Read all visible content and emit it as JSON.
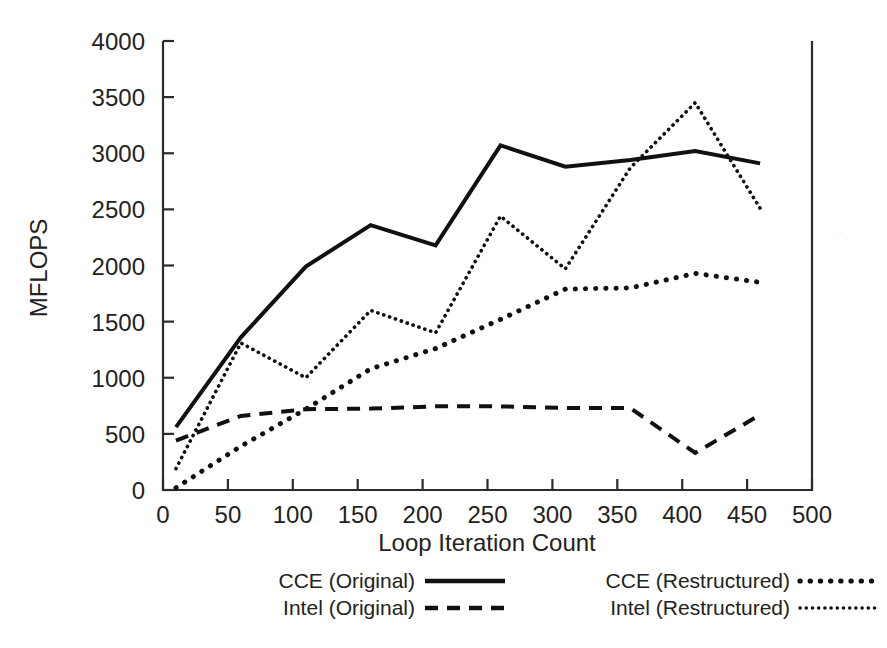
{
  "chart_data": {
    "type": "line",
    "title": "",
    "xlabel": "Loop Iteration Count",
    "ylabel": "MFLOPS",
    "xlim": [
      0,
      500
    ],
    "ylim": [
      0,
      4000
    ],
    "xticks": [
      0,
      50,
      100,
      150,
      200,
      250,
      300,
      350,
      400,
      450,
      500
    ],
    "yticks": [
      0,
      500,
      1000,
      1500,
      2000,
      2500,
      3000,
      3500,
      4000
    ],
    "grid": false,
    "legend_position": "below-axes",
    "x": [
      10,
      60,
      110,
      160,
      210,
      260,
      310,
      360,
      410,
      460
    ],
    "series": [
      {
        "name": "CCE (Original)",
        "style": "solid",
        "values": [
          560,
          1360,
          1990,
          2360,
          2180,
          3070,
          2880,
          2940,
          3020,
          2910
        ]
      },
      {
        "name": "Intel (Original)",
        "style": "dashed",
        "values": [
          440,
          660,
          720,
          725,
          745,
          745,
          730,
          730,
          330,
          670
        ]
      },
      {
        "name": "CCE (Restructured)",
        "style": "dotted-coarse",
        "values": [
          20,
          390,
          720,
          1080,
          1260,
          1520,
          1790,
          1800,
          1930,
          1850
        ]
      },
      {
        "name": "Intel (Restructured)",
        "style": "dotted-fine",
        "values": [
          190,
          1310,
          1000,
          1600,
          1400,
          2440,
          1970,
          2870,
          3450,
          2510
        ]
      }
    ]
  },
  "axes": {
    "y_label": "MFLOPS",
    "x_label": "Loop Iteration Count",
    "x_tick_labels": [
      "0",
      "50",
      "100",
      "150",
      "200",
      "250",
      "300",
      "350",
      "400",
      "450",
      "500"
    ],
    "y_tick_labels": [
      "0",
      "500",
      "1000",
      "1500",
      "2000",
      "2500",
      "3000",
      "3500",
      "4000"
    ]
  },
  "legend": {
    "entries": [
      {
        "label": "CCE (Original)",
        "style": "solid"
      },
      {
        "label": "Intel (Original)",
        "style": "dashed"
      },
      {
        "label": "CCE (Restructured)",
        "style": "dotted-coarse"
      },
      {
        "label": "Intel (Restructured)",
        "style": "dotted-fine"
      }
    ]
  },
  "colors": {
    "ink": "#111111",
    "axis": "#2b2b2b",
    "background": "#ffffff"
  }
}
